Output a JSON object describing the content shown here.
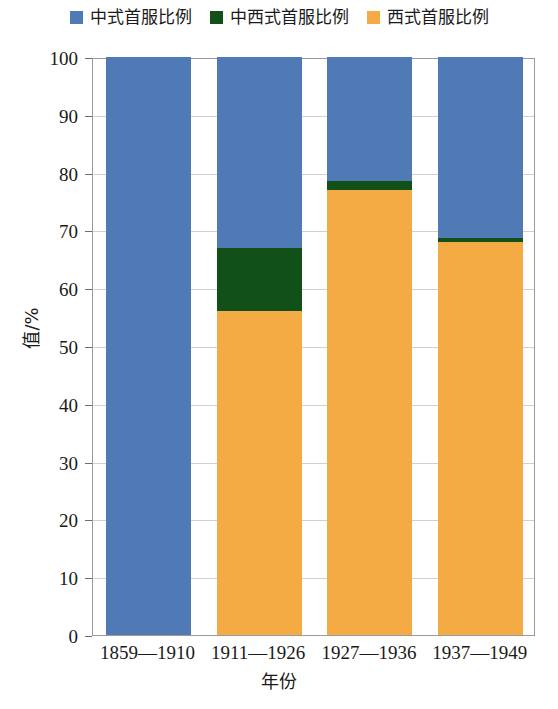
{
  "chart_data": {
    "type": "bar",
    "stacked": true,
    "title": "",
    "xlabel": "年份",
    "ylabel": "值/%",
    "ylim": [
      0,
      100
    ],
    "ytick_step": 10,
    "yticks": [
      0,
      10,
      20,
      30,
      40,
      50,
      60,
      70,
      80,
      90,
      100
    ],
    "grid": true,
    "legend_position": "top-center",
    "categories": [
      "1859—1910",
      "1911—1926",
      "1927—1936",
      "1937—1949"
    ],
    "series": [
      {
        "name": "西式首服比例",
        "color": "#f5ab44",
        "values": [
          0,
          56,
          77,
          68
        ]
      },
      {
        "name": "中西式首服比例",
        "color": "#12501a",
        "values": [
          0,
          11,
          1.5,
          0.7
        ]
      },
      {
        "name": "中式首服比例",
        "color": "#4f7ab5",
        "values": [
          100,
          33,
          21.5,
          31.3
        ]
      }
    ]
  },
  "legend": {
    "items": [
      {
        "label": "中式首服比例",
        "color": "#4f7ab5"
      },
      {
        "label": "中西式首服比例",
        "color": "#12501a"
      },
      {
        "label": "西式首服比例",
        "color": "#f5ab44"
      }
    ]
  },
  "axes": {
    "y_title": "值/%",
    "x_title": "年份",
    "y_tick_labels": [
      "100",
      "90",
      "80",
      "70",
      "60",
      "50",
      "40",
      "30",
      "20",
      "10",
      "0"
    ],
    "x_tick_labels": [
      "1859—1910",
      "1911—1926",
      "1927—1936",
      "1937—1949"
    ]
  },
  "colors": {
    "blue": "#4f7ab5",
    "green": "#12501a",
    "orange": "#f5ab44",
    "gridline": "#d0d0d0",
    "frame": "#9a9a9a"
  }
}
